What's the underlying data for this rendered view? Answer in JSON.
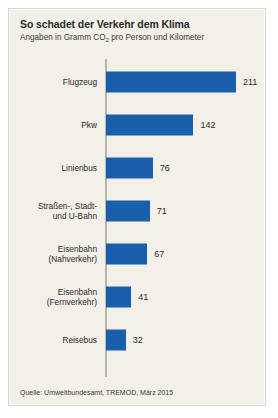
{
  "panel": {
    "background_color": "#f2f0e9",
    "border_color": "#d8d5cb"
  },
  "header": {
    "title": "So schadet der Verkehr dem Klima",
    "subtitle_before": "Angaben in Gramm CO",
    "subtitle_sub": "2",
    "subtitle_after": " pro Person und Kilometer"
  },
  "footer": {
    "source": "Quelle: Umweltbundesamt, TREMOD, März 2015"
  },
  "chart_data": {
    "type": "bar",
    "orientation": "horizontal",
    "title": "So schadet der Verkehr dem Klima",
    "subtitle": "Angaben in Gramm CO2 pro Person und Kilometer",
    "xlabel": "",
    "ylabel": "",
    "unit": "g CO2 pro Person und Kilometer",
    "grid": false,
    "legend": false,
    "bar_color": "#1a5faa",
    "xlim": [
      0,
      211
    ],
    "categories": [
      "Flugzeug",
      "Pkw",
      "Linienbus",
      "Straßen-, Stadt- und U-Bahn",
      "Eisenbahn (Nahverkehr)",
      "Eisenbahn (Fernverkehr)",
      "Reisebus"
    ],
    "values": [
      211,
      142,
      76,
      71,
      67,
      41,
      32
    ],
    "source": "Quelle: Umweltbundesamt, TREMOD, März 2015",
    "bars": [
      {
        "label_line1": "Flugzeug",
        "label_line2": "",
        "value": 211,
        "value_text": "211"
      },
      {
        "label_line1": "Pkw",
        "label_line2": "",
        "value": 142,
        "value_text": "142"
      },
      {
        "label_line1": "Linienbus",
        "label_line2": "",
        "value": 76,
        "value_text": "76"
      },
      {
        "label_line1": "Straßen-, Stadt-",
        "label_line2": "und U-Bahn",
        "value": 71,
        "value_text": "71"
      },
      {
        "label_line1": "Eisenbahn",
        "label_line2": "(Nahverkehr)",
        "value": 67,
        "value_text": "67"
      },
      {
        "label_line1": "Eisenbahn",
        "label_line2": "(Fernverkehr)",
        "value": 41,
        "value_text": "41"
      },
      {
        "label_line1": "Reisebus",
        "label_line2": "",
        "value": 32,
        "value_text": "32"
      }
    ]
  }
}
